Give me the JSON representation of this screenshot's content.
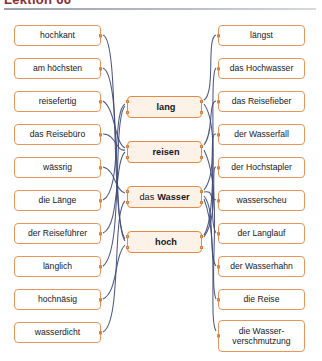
{
  "header": {
    "title": "Lektion 66",
    "rule": "horizontal-rule"
  },
  "exercise": {
    "type": "word-matching",
    "columns": 3,
    "left_column": [
      {
        "label": "hochkant",
        "top": 25,
        "match": "hoch"
      },
      {
        "label": "am höchsten",
        "top": 58,
        "match": "hoch"
      },
      {
        "label": "reisefertig",
        "top": 91,
        "match": "reisen"
      },
      {
        "label": "das Reisebüro",
        "top": 124,
        "match": "reisen"
      },
      {
        "label": "wässrig",
        "top": 157,
        "match": "das Wasser"
      },
      {
        "label": "die Länge",
        "top": 190,
        "match": "lang"
      },
      {
        "label": "der Reiseführer",
        "top": 223,
        "match": "reisen"
      },
      {
        "label": "länglich",
        "top": 256,
        "match": "lang"
      },
      {
        "label": "hochnäsig",
        "top": 289,
        "match": "hoch"
      },
      {
        "label": "wasserdicht",
        "top": 322,
        "match": "das Wasser"
      }
    ],
    "center_column": [
      {
        "article": "",
        "label": "lang",
        "top": 96
      },
      {
        "article": "",
        "label": "reisen",
        "top": 141
      },
      {
        "article": "das",
        "label": "Wasser",
        "top": 186
      },
      {
        "article": "",
        "label": "hoch",
        "top": 231
      }
    ],
    "right_column": [
      {
        "label": "längst",
        "top": 25,
        "match": "lang",
        "tall": false
      },
      {
        "label": "das Hochwasser",
        "top": 58,
        "match": "hoch",
        "tall": false
      },
      {
        "label": "das Reisefieber",
        "top": 91,
        "match": "reisen",
        "tall": false
      },
      {
        "label": "der Wasserfall",
        "top": 124,
        "match": "das Wasser",
        "tall": false
      },
      {
        "label": "der Hochstapler",
        "top": 157,
        "match": "hoch",
        "tall": false
      },
      {
        "label": "wasserscheu",
        "top": 190,
        "match": "das Wasser",
        "tall": false
      },
      {
        "label": "der Langlauf",
        "top": 223,
        "match": "lang",
        "tall": false
      },
      {
        "label": "der Wasserhahn",
        "top": 256,
        "match": "das Wasser",
        "tall": false
      },
      {
        "label": "die Reise",
        "top": 289,
        "match": "reisen",
        "tall": false
      },
      {
        "label": "die Wasser-",
        "label2": "verschmutzung",
        "top": 320,
        "match": "das Wasser",
        "tall": true
      }
    ]
  },
  "colors": {
    "box_border": "#e79559",
    "center_fill": "#fdf2e8",
    "center_border": "#e08a45",
    "connector": "#3f4a78",
    "nub": "#f0a868",
    "title": "#8d2b33",
    "rule": "#9aa0ab"
  }
}
